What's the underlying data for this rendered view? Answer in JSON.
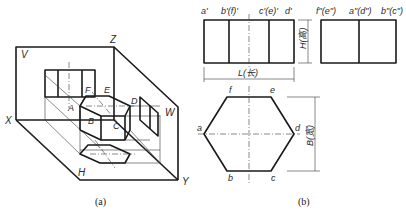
{
  "figure_a": {
    "caption": "(a)",
    "planes": {
      "v": "V",
      "w": "W",
      "h": "H"
    },
    "axes": {
      "x": "X",
      "y": "Y",
      "z": "Z"
    },
    "points": {
      "a": "A",
      "b": "B",
      "c": "C",
      "d": "D",
      "e": "E",
      "f": "F"
    }
  },
  "figure_b": {
    "caption": "(b)",
    "front_view_labels": [
      "a'",
      "b'(f)'",
      "c'(e)'",
      "d'"
    ],
    "side_view_labels": [
      "f\"(e\")",
      "a\"(d\")",
      "b\"(c\")"
    ],
    "top_view_labels": {
      "f": "f",
      "e": "e",
      "a": "a",
      "d": "d",
      "b": "b",
      "c": "c"
    },
    "dimensions": {
      "length": "L(长)",
      "height": "H(高)",
      "width": "B(宽)"
    }
  }
}
